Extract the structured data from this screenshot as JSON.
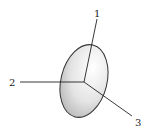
{
  "diagram": {
    "axes": [
      {
        "id": "1",
        "label": "1",
        "direction": "up"
      },
      {
        "id": "2",
        "label": "2",
        "direction": "left"
      },
      {
        "id": "3",
        "label": "3",
        "direction": "down-right"
      }
    ],
    "colors": {
      "line": "#222222",
      "ellipse_stroke": "#333333",
      "shade_light": "#ffffff",
      "shade_dark": "#b8b8b8"
    }
  }
}
